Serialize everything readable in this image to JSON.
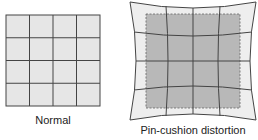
{
  "diagram": {
    "left_caption": "Normal",
    "right_caption": "Pin-cushion distortion",
    "colors": {
      "grid_fill": "#e6e6e6",
      "inner_fill": "#b8b8b8",
      "outer_fill": "#eeeeee",
      "line": "#444444"
    }
  }
}
